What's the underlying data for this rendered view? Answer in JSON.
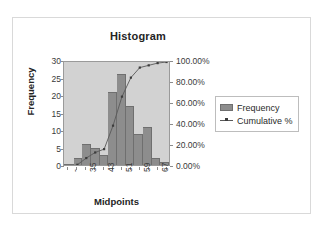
{
  "frame": {
    "border_color": "#d9d9d9"
  },
  "chart_data": {
    "type": "bar",
    "title": "Histogram",
    "xlabel": "Midpoints",
    "ylabel": "Frequency",
    "y2label": "",
    "grid": false,
    "legend_position": "right",
    "plot_background": "#d2d2d2",
    "bar_color": "#8d8d8d",
    "line_color": "#595959",
    "categories": [
      "",
      "31",
      "35",
      "39",
      "43",
      "47",
      "51",
      "55",
      "59",
      "63",
      "67",
      "More"
    ],
    "values": [
      0,
      2,
      6,
      5,
      3,
      21,
      26,
      17,
      9,
      11,
      2,
      1
    ],
    "ylim": [
      0,
      30
    ],
    "yticks": [
      "0",
      "5",
      "10",
      "15",
      "20",
      "25",
      "30"
    ],
    "y2lim": [
      0,
      100
    ],
    "y2ticks": [
      "0.00%",
      "20.00%",
      "40.00%",
      "60.00%",
      "80.00%",
      "100.00%"
    ],
    "xtick_labels": [
      "-",
      "35",
      "43",
      "51",
      "59",
      "67"
    ],
    "series": [
      {
        "name": "Frequency",
        "type": "bar",
        "values": [
          0,
          2,
          6,
          5,
          3,
          21,
          26,
          17,
          9,
          11,
          2,
          1
        ]
      },
      {
        "name": "Cumulative %",
        "type": "line",
        "axis": "secondary",
        "values": [
          0.0,
          2.13,
          8.51,
          13.83,
          17.02,
          39.36,
          67.02,
          85.11,
          94.68,
          96.81,
          98.94,
          100.0
        ]
      }
    ]
  },
  "legend": {
    "items": [
      {
        "label": "Frequency",
        "marker": "swatch"
      },
      {
        "label": "Cumulative %",
        "marker": "line"
      }
    ]
  }
}
